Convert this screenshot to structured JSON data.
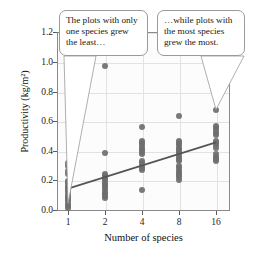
{
  "chart_data": {
    "type": "scatter",
    "title": "",
    "xlabel": "Number of species",
    "ylabel": "Productivity (kg/m²)",
    "x_categories": [
      "1",
      "2",
      "4",
      "8",
      "16"
    ],
    "x_tick_labels": [
      "1",
      "2",
      "4",
      "8",
      "16"
    ],
    "y_tick_labels": [
      "0.0",
      "0.2",
      "0.4",
      "0.6",
      "0.8",
      "1.0",
      "1.2"
    ],
    "ylim": [
      0.0,
      1.2
    ],
    "y_ticks": [
      0.0,
      0.2,
      0.4,
      0.6,
      0.8,
      1.0,
      1.2
    ],
    "grid": "light gray horizontal and vertical gridlines",
    "legend": "none",
    "point_color": "#6e6e6e",
    "trendline_color": "#555555",
    "series": [
      {
        "name": "Productivity by species richness",
        "points": [
          {
            "x": "1",
            "y": 0.32
          },
          {
            "x": "1",
            "y": 0.3
          },
          {
            "x": "1",
            "y": 0.27
          },
          {
            "x": "1",
            "y": 0.25
          },
          {
            "x": "1",
            "y": 0.2
          },
          {
            "x": "1",
            "y": 0.185
          },
          {
            "x": "1",
            "y": 0.17
          },
          {
            "x": "1",
            "y": 0.155
          },
          {
            "x": "1",
            "y": 0.14
          },
          {
            "x": "1",
            "y": 0.125
          },
          {
            "x": "1",
            "y": 0.11
          },
          {
            "x": "1",
            "y": 0.095
          },
          {
            "x": "1",
            "y": 0.08
          },
          {
            "x": "1",
            "y": 0.065
          },
          {
            "x": "1",
            "y": 0.05
          },
          {
            "x": "1",
            "y": 0.035
          },
          {
            "x": "1",
            "y": 0.02
          },
          {
            "x": "2",
            "y": 0.97
          },
          {
            "x": "2",
            "y": 0.39
          },
          {
            "x": "2",
            "y": 0.25
          },
          {
            "x": "2",
            "y": 0.235
          },
          {
            "x": "2",
            "y": 0.22
          },
          {
            "x": "2",
            "y": 0.205
          },
          {
            "x": "2",
            "y": 0.19
          },
          {
            "x": "2",
            "y": 0.175
          },
          {
            "x": "2",
            "y": 0.16
          },
          {
            "x": "2",
            "y": 0.145
          },
          {
            "x": "2",
            "y": 0.13
          },
          {
            "x": "2",
            "y": 0.115
          },
          {
            "x": "2",
            "y": 0.1
          },
          {
            "x": "2",
            "y": 0.09
          },
          {
            "x": "4",
            "y": 0.56
          },
          {
            "x": "4",
            "y": 0.47
          },
          {
            "x": "4",
            "y": 0.455
          },
          {
            "x": "4",
            "y": 0.44
          },
          {
            "x": "4",
            "y": 0.425
          },
          {
            "x": "4",
            "y": 0.41
          },
          {
            "x": "4",
            "y": 0.395
          },
          {
            "x": "4",
            "y": 0.38
          },
          {
            "x": "4",
            "y": 0.335
          },
          {
            "x": "4",
            "y": 0.32
          },
          {
            "x": "4",
            "y": 0.305
          },
          {
            "x": "4",
            "y": 0.29
          },
          {
            "x": "4",
            "y": 0.275
          },
          {
            "x": "4",
            "y": 0.14
          },
          {
            "x": "8",
            "y": 0.64
          },
          {
            "x": "8",
            "y": 0.47
          },
          {
            "x": "8",
            "y": 0.455
          },
          {
            "x": "8",
            "y": 0.44
          },
          {
            "x": "8",
            "y": 0.425
          },
          {
            "x": "8",
            "y": 0.41
          },
          {
            "x": "8",
            "y": 0.395
          },
          {
            "x": "8",
            "y": 0.38
          },
          {
            "x": "8",
            "y": 0.365
          },
          {
            "x": "8",
            "y": 0.35
          },
          {
            "x": "8",
            "y": 0.335
          },
          {
            "x": "8",
            "y": 0.3
          },
          {
            "x": "8",
            "y": 0.285
          },
          {
            "x": "8",
            "y": 0.27
          },
          {
            "x": "8",
            "y": 0.255
          },
          {
            "x": "8",
            "y": 0.24
          },
          {
            "x": "8",
            "y": 0.225
          },
          {
            "x": "8",
            "y": 0.21
          },
          {
            "x": "16",
            "y": 0.68
          },
          {
            "x": "16",
            "y": 0.57
          },
          {
            "x": "16",
            "y": 0.555
          },
          {
            "x": "16",
            "y": 0.54
          },
          {
            "x": "16",
            "y": 0.525
          },
          {
            "x": "16",
            "y": 0.51
          },
          {
            "x": "16",
            "y": 0.47
          },
          {
            "x": "16",
            "y": 0.455
          },
          {
            "x": "16",
            "y": 0.44
          },
          {
            "x": "16",
            "y": 0.425
          },
          {
            "x": "16",
            "y": 0.38
          },
          {
            "x": "16",
            "y": 0.365
          },
          {
            "x": "16",
            "y": 0.35
          },
          {
            "x": "16",
            "y": 0.335
          }
        ]
      }
    ],
    "trendline": {
      "description": "straight regression line rising left to right",
      "start": {
        "x": "1",
        "y": 0.15
      },
      "end": {
        "x": "16",
        "y": 0.46
      }
    },
    "annotations": [
      {
        "id": "callout-left",
        "text": "The plots with only one species grew the least…",
        "points_to": {
          "x": "1",
          "y": 0.05
        }
      },
      {
        "id": "callout-right",
        "text": "…while plots with the most species grew the most.",
        "points_to": {
          "x": "16",
          "y": 0.68
        }
      }
    ]
  }
}
